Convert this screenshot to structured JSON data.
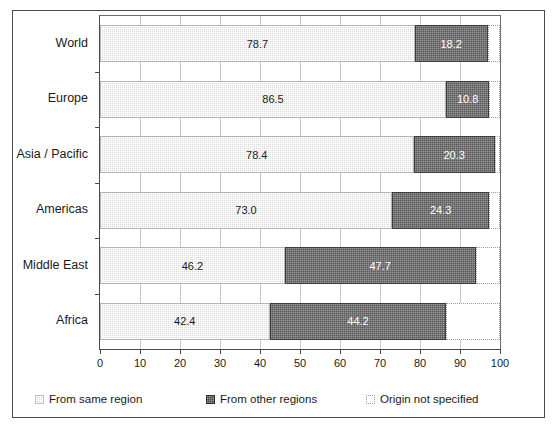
{
  "chart_data": {
    "type": "bar",
    "orientation": "horizontal",
    "stacked": true,
    "title": "",
    "xlabel": "",
    "ylabel": "",
    "xlim": [
      0,
      100
    ],
    "xticks": [
      0,
      10,
      20,
      30,
      40,
      50,
      60,
      70,
      80,
      90,
      100
    ],
    "grid": true,
    "grid_axis": "x",
    "legend_position": "bottom",
    "categories": [
      "World",
      "Europe",
      "Asia / Pacific",
      "Americas",
      "Middle East",
      "Africa"
    ],
    "series": [
      {
        "name": "From same region",
        "color": "#d9d9d9",
        "values": [
          78.7,
          86.5,
          78.4,
          73.0,
          46.2,
          42.4
        ],
        "labels": [
          "78.7",
          "86.5",
          "78.4",
          "73.0",
          "46.2",
          "42.4"
        ]
      },
      {
        "name": "From other regions",
        "color": "#5a5a5a",
        "values": [
          18.2,
          10.8,
          20.3,
          24.3,
          47.7,
          44.2
        ],
        "labels": [
          "18.2",
          "10.8",
          "20.3",
          "24.3",
          "47.7",
          "44.2"
        ]
      },
      {
        "name": "Origin not specified",
        "color": "#ffffff",
        "values": [
          3.1,
          2.7,
          1.3,
          2.7,
          6.1,
          13.4
        ],
        "labels": [
          "",
          "",
          "",
          "",
          "",
          ""
        ]
      }
    ]
  },
  "axis": {
    "x_tick_labels": [
      "0",
      "10",
      "20",
      "30",
      "40",
      "50",
      "60",
      "70",
      "80",
      "90",
      "100"
    ],
    "category_labels": [
      "World",
      "Europe",
      "Asia / Pacific",
      "Americas",
      "Middle East",
      "Africa"
    ]
  },
  "legend": {
    "items": [
      {
        "label": "From same region",
        "swatch": "swatch-same-region"
      },
      {
        "label": "From other regions",
        "swatch": "swatch-other-regions"
      },
      {
        "label": "Origin not specified",
        "swatch": "swatch-not-specified"
      }
    ]
  }
}
